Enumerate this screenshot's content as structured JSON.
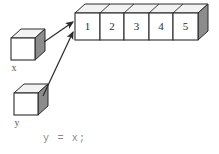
{
  "figure": {
    "background_color": "#ffffff",
    "stroke_color": "#2b2b2b",
    "shade_color": "#8c8c8c",
    "top_face_color": "#f2f2f2",
    "front_face_color": "#ffffff"
  },
  "array": {
    "name": "array-object",
    "cells": [
      {
        "label": "1"
      },
      {
        "label": "2"
      },
      {
        "label": "3"
      },
      {
        "label": "4"
      },
      {
        "label": "5"
      }
    ]
  },
  "variables": [
    {
      "name": "x",
      "label": "x"
    },
    {
      "name": "y",
      "label": "y"
    }
  ],
  "arrows": [
    {
      "from": "x",
      "to": "array-cell-1"
    },
    {
      "from": "y",
      "to": "array-cell-1"
    }
  ],
  "caption": {
    "code": "y = x;"
  }
}
